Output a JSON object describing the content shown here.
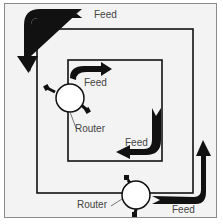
{
  "diagram": {
    "type": "dual-ring network",
    "colors": {
      "background": "#f3f3f3",
      "frame": "#8a8a8a",
      "ring": "#111111",
      "arrow": "#111111",
      "router_fill": "#ffffff",
      "label": "#444444"
    },
    "rings": [
      {
        "name": "outer-ring",
        "bounds": [
          37,
          29,
          193,
          193
        ]
      },
      {
        "name": "inner-ring",
        "bounds": [
          68,
          60,
          162,
          161
        ]
      }
    ],
    "labels": {
      "feed_outer_top": "Feed",
      "feed_inner_top": "Feed",
      "feed_inner_bottom": "Feed",
      "feed_outer_bottom": "Feed",
      "router_inner": "Router",
      "router_outer": "Router"
    },
    "arrows": [
      {
        "name": "feed-arrow-outer-top",
        "direction": "counter-clockwise (left then down)"
      },
      {
        "name": "feed-arrow-inner-top",
        "direction": "clockwise (up then right)"
      },
      {
        "name": "feed-arrow-inner-bottom",
        "direction": "down then left"
      },
      {
        "name": "feed-arrow-outer-bottom",
        "direction": "right then up"
      }
    ],
    "routers": [
      {
        "name": "router-inner",
        "position": [
          68,
          99
        ]
      },
      {
        "name": "router-outer",
        "position": [
          137,
          193
        ]
      }
    ]
  }
}
